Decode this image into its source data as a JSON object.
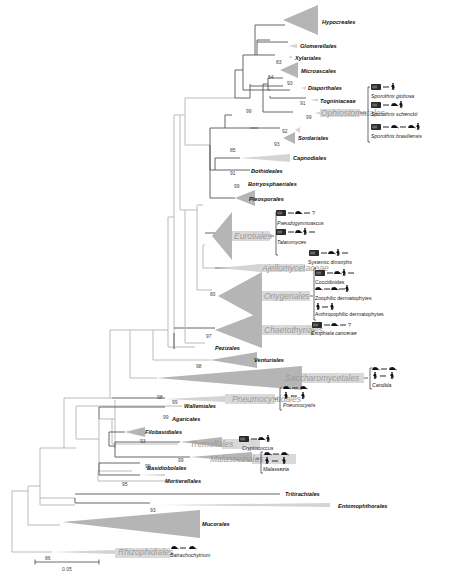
{
  "figure": {
    "type": "phylogenetic-tree",
    "scale_bar": {
      "label": "0.05"
    },
    "orders": [
      {
        "name": "Hypocreales",
        "bootstrap": null
      },
      {
        "name": "Glomerellales",
        "bootstrap": null
      },
      {
        "name": "Xylariales",
        "bootstrap": "83"
      },
      {
        "name": "Microascales",
        "bootstrap": "84"
      },
      {
        "name": "Diaporthales",
        "bootstrap": "93"
      },
      {
        "name": "Togniniaceae",
        "bootstrap": "91"
      },
      {
        "name": "Ophiostomatales",
        "bootstrap": "99",
        "highlight": true
      },
      {
        "name": "",
        "bootstrap": "92"
      },
      {
        "name": "Sordariales",
        "bootstrap": "93"
      },
      {
        "name": "Capnodiales",
        "bootstrap": "85"
      },
      {
        "name": "Dothideales",
        "bootstrap": "91"
      },
      {
        "name": "Botryosphaeriales",
        "bootstrap": "99"
      },
      {
        "name": "Pleosporales",
        "bootstrap": null
      },
      {
        "name": "Eurotiales",
        "bootstrap": null,
        "highlight": true
      },
      {
        "name": "Ajellomycetaceae",
        "bootstrap": null,
        "highlight": true
      },
      {
        "name": "Onygenales",
        "bootstrap": "80",
        "highlight": true
      },
      {
        "name": "Chaetothyriales",
        "bootstrap": "97",
        "highlight": true
      },
      {
        "name": "Pezizales",
        "bootstrap": null
      },
      {
        "name": "Venturiales",
        "bootstrap": "98"
      },
      {
        "name": "Saccharomycetales",
        "bootstrap": null,
        "highlight": true
      },
      {
        "name": "Pneumocystidales",
        "bootstrap": "98",
        "highlight": true
      },
      {
        "name": "Wallemiales",
        "bootstrap": "99"
      },
      {
        "name": "Agaricales",
        "bootstrap": "99"
      },
      {
        "name": "Filobasidiales",
        "bootstrap": null
      },
      {
        "name": "Tremellales",
        "bootstrap": "93",
        "highlight": true
      },
      {
        "name": "Malasseziales",
        "bootstrap": "99",
        "highlight": true
      },
      {
        "name": "Basidiobolales",
        "bootstrap": "99"
      },
      {
        "name": "Mortierellales",
        "bootstrap": "95"
      },
      {
        "name": "Tritirachiales",
        "bootstrap": null
      },
      {
        "name": "Entomophthorales",
        "bootstrap": "93"
      },
      {
        "name": "Mucorales",
        "bootstrap": null
      },
      {
        "name": "Rhizophidiales",
        "bootstrap": "86",
        "highlight": true
      }
    ],
    "node_support": {
      "sordariomycetes_root": "99"
    },
    "annotations": {
      "ophiostomatales": [
        "Sporothrix globosa",
        "Sporothrix schenckii",
        "Sporothrix brasiliensis"
      ],
      "eurotiales": [
        "Pseudogymnoascus",
        "Talaromyces"
      ],
      "ajellomycetaceae": [
        "Systemic dimorphs"
      ],
      "onygenales": [
        "Coccidioides",
        "Zoophilic dermatophytes",
        "Anthropophilic dermatophytes"
      ],
      "chaetothyriales": [
        "Exophiala cancerae"
      ],
      "saccharomycetales": [
        "Candida"
      ],
      "pneumocystidales": [
        "Pneumocystis"
      ],
      "tremellales": [
        "Cryptococcus"
      ],
      "malasseziales": [
        "Malassezia"
      ],
      "rhizophidiales": [
        "Batrachochytrium"
      ]
    },
    "unknown_mark": "?",
    "env_icon_label": "Env"
  }
}
